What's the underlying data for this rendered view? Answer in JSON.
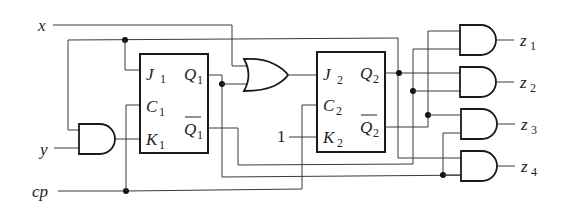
{
  "diagram": {
    "type": "sequential logic circuit",
    "inputs": [
      {
        "id": "x",
        "label": "x"
      },
      {
        "id": "y",
        "label": "y"
      },
      {
        "id": "cp",
        "label": "cp"
      }
    ],
    "constant": {
      "label": "1",
      "connects_to": "K2"
    },
    "flip_flops": [
      {
        "id": "FF1",
        "pins": {
          "J": "J",
          "J_sub": "1",
          "C": "C",
          "C_sub": "1",
          "K": "K",
          "K_sub": "1",
          "Q": "Q",
          "Q_sub": "1",
          "Qbar": "Q",
          "Qbar_sub": "1"
        }
      },
      {
        "id": "FF2",
        "pins": {
          "J": "J",
          "J_sub": "2",
          "C": "C",
          "C_sub": "2",
          "K": "K",
          "K_sub": "2",
          "Q": "Q",
          "Q_sub": "2",
          "Qbar": "Q",
          "Qbar_sub": "2"
        }
      }
    ],
    "gates": [
      {
        "id": "and_in",
        "type": "AND",
        "inputs": [
          "feedback",
          "y"
        ],
        "output": "K1"
      },
      {
        "id": "or_1",
        "type": "OR",
        "inputs": [
          "x",
          "Q1"
        ],
        "output": "J2"
      },
      {
        "id": "and_z1",
        "type": "AND",
        "inputs": [
          "Q2bar",
          "Q1bar"
        ],
        "output": "z1"
      },
      {
        "id": "and_z2",
        "type": "AND",
        "inputs": [
          "Q2",
          "Q1bar"
        ],
        "output": "z2"
      },
      {
        "id": "and_z3",
        "type": "AND",
        "inputs": [
          "Q2bar",
          "Q1"
        ],
        "output": "z3"
      },
      {
        "id": "and_z4",
        "type": "AND",
        "inputs": [
          "Q2",
          "Q1"
        ],
        "output": "z4"
      }
    ],
    "outputs": [
      {
        "id": "z1",
        "label": "z",
        "sub": "1"
      },
      {
        "id": "z2",
        "label": "z",
        "sub": "2"
      },
      {
        "id": "z3",
        "label": "z",
        "sub": "3"
      },
      {
        "id": "z4",
        "label": "z",
        "sub": "4"
      }
    ]
  },
  "colors": {
    "line": "#3a3a3a",
    "box": "#1a1a1a",
    "background": "#ffffff"
  }
}
